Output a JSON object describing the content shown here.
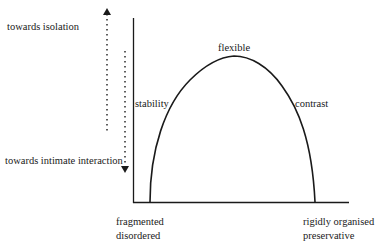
{
  "diagram": {
    "axis_labels": {
      "top_arrow": "towards isolation",
      "bottom_arrow": "towards intimate interaction"
    },
    "curve_labels": {
      "peak": "flexible",
      "left_side": "stability",
      "right_side": "contrast"
    },
    "x_axis_ends": {
      "left_line1": "fragmented",
      "left_line2": "disordered",
      "right_line1": "rigidly organised",
      "right_line2": "preservative"
    },
    "colors": {
      "line": "#1a1a1a",
      "background": "#ffffff"
    }
  }
}
